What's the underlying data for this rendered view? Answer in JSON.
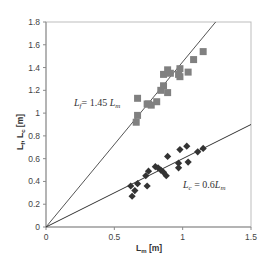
{
  "chart_data": {
    "type": "scatter",
    "title": "",
    "xlabel": "L_m [m]",
    "ylabel": "L_f, L_c [m]",
    "xlim": [
      0,
      1.5
    ],
    "ylim": [
      0,
      1.8
    ],
    "xticks": [
      0,
      0.5,
      1,
      1.5
    ],
    "xtick_labels": [
      "0",
      "0.5",
      "1",
      "1.5"
    ],
    "yticks": [
      0,
      0.2,
      0.4,
      0.6,
      0.8,
      1,
      1.2,
      1.4,
      1.6,
      1.8
    ],
    "ytick_labels": [
      "0",
      "0.2",
      "0.4",
      "0.6",
      "0.8",
      "1",
      "1.2",
      "1.4",
      "1.6",
      "1.8"
    ],
    "grid": false,
    "legend": "none",
    "series": [
      {
        "name": "L_f",
        "marker": "square",
        "color": "#808080",
        "points": [
          [
            0.66,
            0.92
          ],
          [
            0.67,
            0.98
          ],
          [
            0.67,
            1.13
          ],
          [
            0.74,
            1.08
          ],
          [
            0.75,
            1.08
          ],
          [
            0.77,
            1.07
          ],
          [
            0.81,
            1.1
          ],
          [
            0.84,
            1.2
          ],
          [
            0.86,
            1.24
          ],
          [
            0.89,
            1.18
          ],
          [
            0.86,
            1.34
          ],
          [
            0.89,
            1.38
          ],
          [
            0.91,
            1.35
          ],
          [
            0.97,
            1.34
          ],
          [
            0.98,
            1.39
          ],
          [
            1.04,
            1.36
          ],
          [
            0.98,
            1.32
          ],
          [
            1.08,
            1.47
          ],
          [
            1.15,
            1.54
          ]
        ]
      },
      {
        "name": "L_c",
        "marker": "diamond",
        "color": "#333333",
        "points": [
          [
            0.62,
            0.36
          ],
          [
            0.63,
            0.27
          ],
          [
            0.65,
            0.32
          ],
          [
            0.67,
            0.38
          ],
          [
            0.73,
            0.45
          ],
          [
            0.74,
            0.36
          ],
          [
            0.75,
            0.49
          ],
          [
            0.8,
            0.53
          ],
          [
            0.82,
            0.52
          ],
          [
            0.84,
            0.5
          ],
          [
            0.86,
            0.48
          ],
          [
            0.89,
            0.62
          ],
          [
            0.88,
            0.45
          ],
          [
            0.98,
            0.68
          ],
          [
            0.97,
            0.56
          ],
          [
            0.97,
            0.52
          ],
          [
            1.03,
            0.71
          ],
          [
            1.04,
            0.57
          ],
          [
            1.11,
            0.66
          ],
          [
            1.15,
            0.69
          ]
        ]
      }
    ],
    "fit_lines": [
      {
        "name": "L_f fit",
        "slope": 1.45,
        "intercept": 0,
        "color": "#555555"
      },
      {
        "name": "L_c fit",
        "slope": 0.6,
        "intercept": 0,
        "color": "#333333"
      }
    ],
    "annotations": [
      {
        "text": "L_f = 1.45 L_m",
        "x": 0.2,
        "y": 1.06
      },
      {
        "text": "L_c = 0.6L_m",
        "x": 1.02,
        "y": 0.42
      }
    ]
  },
  "labels": {
    "xlabel_main": "L",
    "xlabel_sub": "m",
    "xlabel_unit": " [m]",
    "ylabel_f": "L",
    "ylabel_f_sub": "f",
    "ylabel_sep": ", ",
    "ylabel_c": "L",
    "ylabel_c_sub": "c",
    "ylabel_unit": " [m]",
    "annot_f_L": "L",
    "annot_f_sub": "f",
    "annot_f_rest": "= 1.45 ",
    "annot_f_Lm": "L",
    "annot_f_Lm_sub": "m",
    "annot_c_L": "L",
    "annot_c_sub": "c",
    "annot_c_rest": " = 0.6",
    "annot_c_Lm": "L",
    "annot_c_Lm_sub": "m"
  }
}
